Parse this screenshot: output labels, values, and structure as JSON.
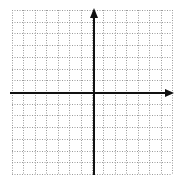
{
  "diagram": {
    "type": "coordinate-plane",
    "grid": {
      "left": 12,
      "top": 10,
      "right": 172,
      "bottom": 174,
      "cell": 11.7,
      "columns": 14,
      "rows": 14,
      "line_color": "#9a9a9a",
      "dash": "1,1.5"
    },
    "axes": {
      "color": "#111111",
      "width": 2,
      "origin": {
        "x": 94,
        "y": 93
      },
      "x_axis": {
        "x1": 10,
        "x2": 174,
        "arrow": "right"
      },
      "y_axis": {
        "y1": 8,
        "y2": 175,
        "arrow": "up"
      }
    }
  }
}
